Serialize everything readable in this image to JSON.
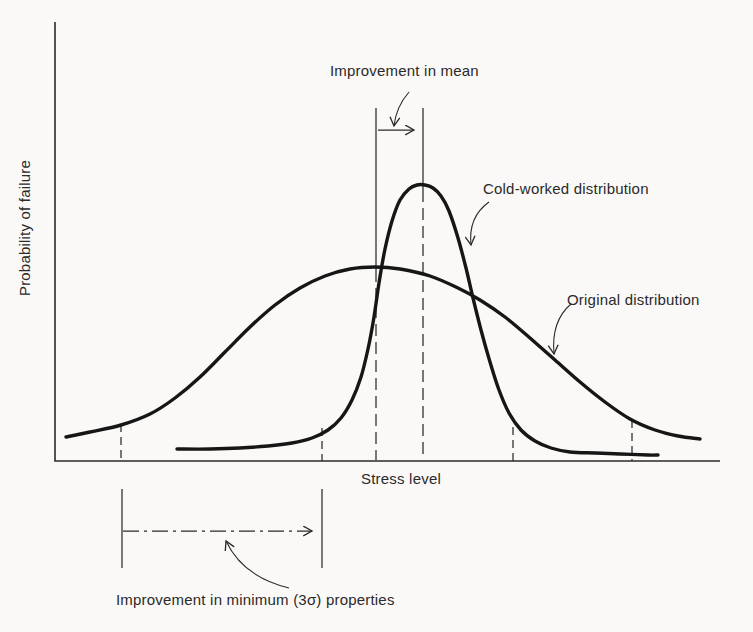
{
  "figure": {
    "background": "#faf9f7",
    "ink": "#2a2a2a",
    "curve_color": "#161616"
  },
  "chart_data": {
    "type": "line",
    "title": "",
    "xlabel": "Stress level",
    "ylabel": "Probability of failure",
    "x_axis_ticks": [],
    "y_axis_ticks": [],
    "grid": false,
    "legend_position": "inline-labels-with-leader-arrows",
    "series": [
      {
        "name": "Original distribution",
        "description": "wide, low bell curve centered near middle of stress axis",
        "points": [
          [
            66,
            437
          ],
          [
            90,
            432
          ],
          [
            121,
            425
          ],
          [
            150,
            414
          ],
          [
            175,
            398
          ],
          [
            200,
            377
          ],
          [
            225,
            352
          ],
          [
            250,
            327
          ],
          [
            275,
            305
          ],
          [
            300,
            288
          ],
          [
            325,
            276
          ],
          [
            350,
            269
          ],
          [
            375,
            267
          ],
          [
            400,
            269
          ],
          [
            430,
            276
          ],
          [
            458,
            288
          ],
          [
            480,
            300
          ],
          [
            505,
            317
          ],
          [
            530,
            338
          ],
          [
            555,
            360
          ],
          [
            580,
            382
          ],
          [
            605,
            402
          ],
          [
            630,
            419
          ],
          [
            655,
            430
          ],
          [
            678,
            436
          ],
          [
            700,
            439
          ]
        ]
      },
      {
        "name": "Cold-worked distribution",
        "description": "narrow, tall bell curve with mean shifted right of the original mean",
        "points": [
          [
            177,
            449
          ],
          [
            210,
            449
          ],
          [
            240,
            448
          ],
          [
            268,
            446
          ],
          [
            292,
            443
          ],
          [
            312,
            438
          ],
          [
            328,
            430
          ],
          [
            341,
            418
          ],
          [
            352,
            400
          ],
          [
            361,
            377
          ],
          [
            368,
            349
          ],
          [
            374,
            317
          ],
          [
            379,
            283
          ],
          [
            385,
            249
          ],
          [
            392,
            221
          ],
          [
            400,
            200
          ],
          [
            409,
            189
          ],
          [
            417,
            185
          ],
          [
            425,
            185
          ],
          [
            433,
            188
          ],
          [
            441,
            196
          ],
          [
            449,
            211
          ],
          [
            458,
            238
          ],
          [
            466,
            268
          ],
          [
            473,
            298
          ],
          [
            481,
            330
          ],
          [
            490,
            362
          ],
          [
            499,
            390
          ],
          [
            509,
            413
          ],
          [
            521,
            430
          ],
          [
            535,
            441
          ],
          [
            551,
            448
          ],
          [
            570,
            452
          ],
          [
            595,
            453
          ],
          [
            620,
            454
          ],
          [
            648,
            455
          ],
          [
            658,
            455
          ]
        ]
      }
    ],
    "annotations": [
      {
        "id": "improvement-in-mean",
        "text": "Improvement in mean",
        "meaning": "horizontal arrow between original mean line (x=376) and cold-worked mean line (x=423)"
      },
      {
        "id": "improvement-in-minimum",
        "text": "Improvement in minimum (3σ) properties",
        "meaning": "dash-dot arrow below axis from original -3σ point (x=122) to cold-worked -3σ point (x=322)"
      }
    ]
  },
  "geometry": {
    "width": 753,
    "height": 632,
    "axis_path": "M55,22 L55,461 L720,461",
    "lines": [
      {
        "name": "mean-line-original-solid",
        "x1": 376,
        "y1": 108,
        "x2": 376,
        "y2": 270
      },
      {
        "name": "mean-line-original-dashed",
        "x1": 376,
        "y1": 270,
        "x2": 376,
        "y2": 460,
        "dash": "12 6"
      },
      {
        "name": "mean-line-cold-solid",
        "x1": 423,
        "y1": 108,
        "x2": 423,
        "y2": 190
      },
      {
        "name": "mean-line-cold-dashed",
        "x1": 423,
        "y1": 190,
        "x2": 423,
        "y2": 458,
        "dash": "12 6"
      },
      {
        "name": "mean-shift-arrow",
        "x1": 378,
        "y1": 130,
        "x2": 414,
        "y2": 130,
        "arrow": true
      },
      {
        "name": "tick-minus3sigma-original",
        "x1": 121,
        "y1": 424,
        "x2": 121,
        "y2": 461,
        "dash": "8 5"
      },
      {
        "name": "tick-minus3sigma-cold",
        "x1": 322,
        "y1": 428,
        "x2": 322,
        "y2": 461,
        "dash": "8 5"
      },
      {
        "name": "tick-plus3sigma-cold",
        "x1": 513,
        "y1": 427,
        "x2": 513,
        "y2": 461,
        "dash": "8 5"
      },
      {
        "name": "tick-plus3sigma-original",
        "x1": 632,
        "y1": 420,
        "x2": 632,
        "y2": 461,
        "dash": "8 5"
      },
      {
        "name": "range-bar-left",
        "x1": 122,
        "y1": 489,
        "x2": 122,
        "y2": 568
      },
      {
        "name": "range-bar-right",
        "x1": 322,
        "y1": 489,
        "x2": 322,
        "y2": 568
      },
      {
        "name": "sigma-shift-arrow",
        "x1": 123,
        "y1": 531,
        "x2": 312,
        "y2": 531,
        "dash": "16 5 3 5",
        "arrow": true
      }
    ],
    "leaders": [
      {
        "name": "leader-improvement-mean",
        "d": "M409,92 Q396,107 394,126"
      },
      {
        "name": "leader-cold-worked",
        "d": "M489,202 Q468,217 471,245"
      },
      {
        "name": "leader-original",
        "d": "M571,304 Q551,321 554,354"
      },
      {
        "name": "leader-improvement-min",
        "d": "M289,588 Q243,577 226,541"
      }
    ]
  }
}
